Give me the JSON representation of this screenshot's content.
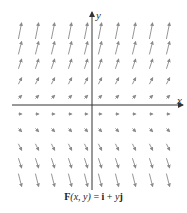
{
  "figure": {
    "caption_parts": {
      "F": "F",
      "args": "(x, y)",
      "eq": " = ",
      "i": "i",
      "plus": " + ",
      "y": "y",
      "j": "j"
    },
    "caption_text": "F(x, y) = i + yj",
    "axes": {
      "x_label": "x",
      "y_label": "y",
      "origin_px": [
        92,
        105
      ],
      "x_axis_px": [
        12,
        183
      ],
      "y_axis_px": [
        12,
        190
      ]
    },
    "arrow_color": "#8a8a8a",
    "axis_color": "#333333"
  },
  "vector_field": {
    "formula": "F(x, y) = i + yj",
    "x_values": [
      -5,
      -4,
      -3,
      -2,
      -1,
      1,
      2,
      3,
      4,
      5
    ],
    "y_values": [
      5,
      4,
      3,
      2,
      1,
      0,
      -1,
      -2,
      -3,
      -4
    ],
    "column_px": [
      20,
      37,
      53,
      70,
      86,
      100,
      117,
      134,
      151,
      168
    ],
    "row_px": [
      31,
      48,
      64,
      81,
      97,
      114,
      130,
      147,
      163,
      180
    ]
  }
}
